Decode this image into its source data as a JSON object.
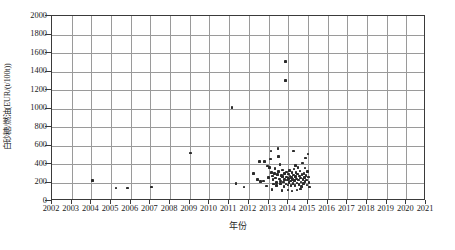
{
  "chart_data": {
    "type": "scatter",
    "title": "",
    "xlabel": "年份",
    "ylabel": "白砂糖/燃油(EUR/(t/100t))",
    "xlim": [
      2002,
      2021
    ],
    "ylim": [
      0,
      2000
    ],
    "grid": true,
    "legend": null,
    "xticks": [
      2002,
      2003,
      2004,
      2005,
      2006,
      2007,
      2008,
      2009,
      2010,
      2011,
      2012,
      2013,
      2014,
      2015,
      2016,
      2017,
      2018,
      2019,
      2020,
      2021
    ],
    "xtick_labels": [
      "2002",
      "2003",
      "2004",
      "2005",
      "2006",
      "2007",
      "2008",
      "2009",
      "2010",
      "2011",
      "2012",
      "2013",
      "2014",
      "2015",
      "2016",
      "2017",
      "2018",
      "2019",
      "2020",
      "2021"
    ],
    "yticks": [
      0,
      200,
      400,
      600,
      800,
      1000,
      1200,
      1400,
      1600,
      1800,
      2000
    ],
    "ytick_labels": [
      "0",
      "200",
      "400",
      "600",
      "800",
      "1000",
      "1200",
      "1400",
      "1600",
      "1800",
      "2000"
    ],
    "marker": "square",
    "marker_color": "#2b2b2b",
    "points": [
      {
        "x": 2004.05,
        "y": 220
      },
      {
        "x": 2005.25,
        "y": 140
      },
      {
        "x": 2005.85,
        "y": 140
      },
      {
        "x": 2007.05,
        "y": 150
      },
      {
        "x": 2009.05,
        "y": 520
      },
      {
        "x": 2011.15,
        "y": 1010
      },
      {
        "x": 2011.35,
        "y": 190
      },
      {
        "x": 2011.75,
        "y": 150
      },
      {
        "x": 2012.25,
        "y": 300
      },
      {
        "x": 2012.45,
        "y": 235
      },
      {
        "x": 2012.55,
        "y": 430
      },
      {
        "x": 2012.6,
        "y": 210
      },
      {
        "x": 2012.75,
        "y": 215
      },
      {
        "x": 2012.9,
        "y": 160
      },
      {
        "x": 2013.0,
        "y": 255
      },
      {
        "x": 2013.05,
        "y": 365
      },
      {
        "x": 2013.1,
        "y": 455
      },
      {
        "x": 2013.12,
        "y": 540
      },
      {
        "x": 2013.15,
        "y": 305
      },
      {
        "x": 2013.2,
        "y": 270
      },
      {
        "x": 2013.22,
        "y": 230
      },
      {
        "x": 2013.25,
        "y": 185
      },
      {
        "x": 2013.3,
        "y": 300
      },
      {
        "x": 2013.32,
        "y": 350
      },
      {
        "x": 2013.35,
        "y": 250
      },
      {
        "x": 2013.4,
        "y": 200
      },
      {
        "x": 2013.42,
        "y": 165
      },
      {
        "x": 2013.45,
        "y": 285
      },
      {
        "x": 2013.5,
        "y": 480
      },
      {
        "x": 2013.52,
        "y": 320
      },
      {
        "x": 2013.55,
        "y": 240
      },
      {
        "x": 2013.6,
        "y": 215
      },
      {
        "x": 2013.62,
        "y": 190
      },
      {
        "x": 2013.65,
        "y": 275
      },
      {
        "x": 2013.7,
        "y": 335
      },
      {
        "x": 2013.72,
        "y": 265
      },
      {
        "x": 2013.75,
        "y": 205
      },
      {
        "x": 2013.78,
        "y": 155
      },
      {
        "x": 2013.8,
        "y": 295
      },
      {
        "x": 2013.82,
        "y": 230
      },
      {
        "x": 2013.85,
        "y": 1505
      },
      {
        "x": 2013.85,
        "y": 1305
      },
      {
        "x": 2013.88,
        "y": 185
      },
      {
        "x": 2013.9,
        "y": 260
      },
      {
        "x": 2013.92,
        "y": 315
      },
      {
        "x": 2013.95,
        "y": 225
      },
      {
        "x": 2013.98,
        "y": 175
      },
      {
        "x": 2014.0,
        "y": 290
      },
      {
        "x": 2014.02,
        "y": 245
      },
      {
        "x": 2014.05,
        "y": 200
      },
      {
        "x": 2014.08,
        "y": 330
      },
      {
        "x": 2014.1,
        "y": 270
      },
      {
        "x": 2014.12,
        "y": 215
      },
      {
        "x": 2014.15,
        "y": 170
      },
      {
        "x": 2014.18,
        "y": 255
      },
      {
        "x": 2014.2,
        "y": 305
      },
      {
        "x": 2014.22,
        "y": 235
      },
      {
        "x": 2014.25,
        "y": 190
      },
      {
        "x": 2014.28,
        "y": 280
      },
      {
        "x": 2014.3,
        "y": 345
      },
      {
        "x": 2014.32,
        "y": 220
      },
      {
        "x": 2014.35,
        "y": 165
      },
      {
        "x": 2014.38,
        "y": 265
      },
      {
        "x": 2014.4,
        "y": 310
      },
      {
        "x": 2014.42,
        "y": 240
      },
      {
        "x": 2014.45,
        "y": 195
      },
      {
        "x": 2014.48,
        "y": 290
      },
      {
        "x": 2014.5,
        "y": 360
      },
      {
        "x": 2014.52,
        "y": 225
      },
      {
        "x": 2014.55,
        "y": 180
      },
      {
        "x": 2014.58,
        "y": 270
      },
      {
        "x": 2014.6,
        "y": 325
      },
      {
        "x": 2014.62,
        "y": 250
      },
      {
        "x": 2014.65,
        "y": 205
      },
      {
        "x": 2014.68,
        "y": 155
      },
      {
        "x": 2014.7,
        "y": 285
      },
      {
        "x": 2014.72,
        "y": 410
      },
      {
        "x": 2014.75,
        "y": 235
      },
      {
        "x": 2014.78,
        "y": 190
      },
      {
        "x": 2014.8,
        "y": 300
      },
      {
        "x": 2014.82,
        "y": 255
      },
      {
        "x": 2014.85,
        "y": 210
      },
      {
        "x": 2014.88,
        "y": 465
      },
      {
        "x": 2014.9,
        "y": 275
      },
      {
        "x": 2014.92,
        "y": 225
      },
      {
        "x": 2014.95,
        "y": 175
      },
      {
        "x": 2014.98,
        "y": 320
      },
      {
        "x": 2015.0,
        "y": 510
      },
      {
        "x": 2015.02,
        "y": 260
      },
      {
        "x": 2015.05,
        "y": 200
      },
      {
        "x": 2015.08,
        "y": 150
      },
      {
        "x": 2012.8,
        "y": 430
      },
      {
        "x": 2013.48,
        "y": 565
      },
      {
        "x": 2014.28,
        "y": 540
      },
      {
        "x": 2014.62,
        "y": 130
      },
      {
        "x": 2013.18,
        "y": 125
      },
      {
        "x": 2013.98,
        "y": 120
      },
      {
        "x": 2014.45,
        "y": 118
      },
      {
        "x": 2013.68,
        "y": 112
      },
      {
        "x": 2014.2,
        "y": 108
      },
      {
        "x": 2012.95,
        "y": 380
      },
      {
        "x": 2013.58,
        "y": 395
      },
      {
        "x": 2014.38,
        "y": 385
      },
      {
        "x": 2014.85,
        "y": 355
      }
    ]
  }
}
